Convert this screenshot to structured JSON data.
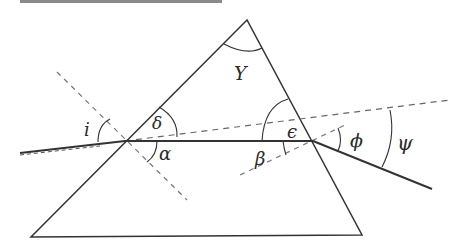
{
  "figure": {
    "colors": {
      "stroke": "#333333",
      "dashed": "#666666",
      "header_bar": "#8a8a8a",
      "background": "#ffffff"
    },
    "labels": {
      "apex_angle": "Υ",
      "incidence": "i",
      "delta": "δ",
      "alpha": "α",
      "beta": "β",
      "epsilon": "ϵ",
      "phi": "ϕ",
      "psi": "ψ"
    },
    "geometry": {
      "apex": [
        247,
        20
      ],
      "base_left": [
        31,
        237
      ],
      "base_right": [
        362,
        235
      ],
      "entry_point": [
        125,
        141
      ],
      "exit_point": [
        313,
        141
      ],
      "incident_ray_start": [
        20,
        153
      ],
      "exit_ray_end": [
        432,
        189
      ]
    }
  }
}
